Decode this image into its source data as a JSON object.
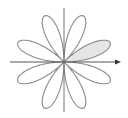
{
  "diagram": {
    "type": "polar-rose",
    "equation": "r = sin(4θ)",
    "petals": 8,
    "shaded_petal_index": 0,
    "colors": {
      "background": "#ffffff",
      "curve": "#8a8a8a",
      "axis": "#555555",
      "shade": "#e6e6e6"
    },
    "center": [
      64,
      62
    ],
    "radius": 50,
    "axes": {
      "x": {
        "from": 10,
        "to": 121,
        "arrow": true
      },
      "y": {
        "from": 8,
        "to": 112,
        "arrow": false
      }
    }
  }
}
